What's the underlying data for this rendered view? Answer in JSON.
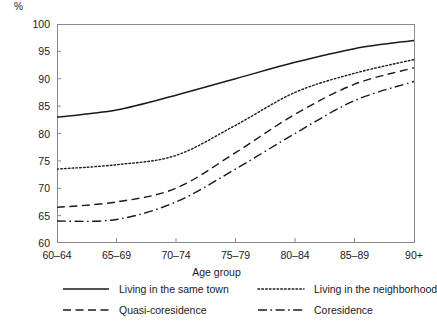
{
  "chart_data": {
    "type": "line",
    "title": "",
    "xlabel": "Age group",
    "ylabel": "%",
    "categories": [
      "60–64",
      "65–69",
      "70–74",
      "75–79",
      "80–84",
      "85–89",
      "90+"
    ],
    "ylim": [
      60,
      100
    ],
    "yticks": [
      60,
      65,
      70,
      75,
      80,
      85,
      90,
      95,
      100
    ],
    "ytick_labels": [
      "60",
      "65",
      "70",
      "75",
      "80",
      "85",
      "90",
      "95",
      "100"
    ],
    "grid": false,
    "legend_position": "bottom",
    "series": [
      {
        "name": "Living in the same town",
        "style": "solid",
        "color": "#1a1a1a",
        "values": [
          83.0,
          84.3,
          87.0,
          90.0,
          93.0,
          95.5,
          97.0
        ]
      },
      {
        "name": "Living in the neighborhood",
        "style": "dotted",
        "color": "#1a1a1a",
        "values": [
          73.5,
          74.3,
          76.0,
          81.5,
          87.5,
          91.0,
          93.5
        ]
      },
      {
        "name": "Quasi-coresidence",
        "style": "dashed",
        "color": "#1a1a1a",
        "values": [
          66.5,
          67.5,
          70.0,
          76.5,
          83.5,
          89.0,
          92.0
        ]
      },
      {
        "name": "Coresidence",
        "style": "dashdot",
        "color": "#1a1a1a",
        "values": [
          64.0,
          64.3,
          67.5,
          73.5,
          80.0,
          86.0,
          89.5
        ]
      }
    ]
  },
  "axis": {
    "y_unit_label": "%",
    "x_title": "Age group"
  }
}
